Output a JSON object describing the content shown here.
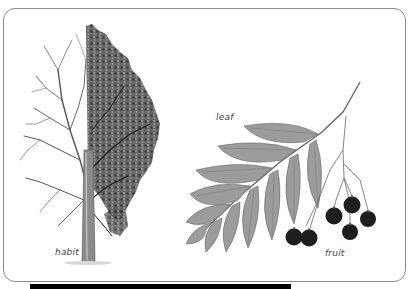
{
  "illustration": {
    "labels": {
      "habit": "habit",
      "leaf": "leaf",
      "fruit": "fruit"
    },
    "panels": [
      {
        "name": "habit",
        "description": "tree habit, half bare winter branches, half in leaf"
      },
      {
        "name": "leaf",
        "description": "pinnate compound leaf"
      },
      {
        "name": "fruit",
        "description": "cluster of dark berries"
      }
    ]
  },
  "colors": {
    "frame": "#8a8a8a",
    "foliage": "#3c3c3c",
    "leaf_fill": "#9a9a9a",
    "berry": "#1e1e1e",
    "bar": "#000000"
  }
}
